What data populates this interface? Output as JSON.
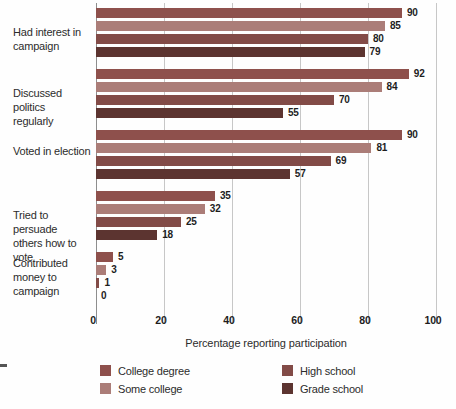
{
  "chart_data": {
    "type": "bar",
    "orientation": "horizontal",
    "title": "",
    "xlabel": "Percentage reporting participation",
    "xlim": [
      0,
      100
    ],
    "xticks": [
      0,
      20,
      40,
      60,
      80,
      100
    ],
    "grid": "vertical",
    "legend_position": "bottom",
    "categories": [
      {
        "label": "Had interest in campaign",
        "lines": [
          "Had interest in",
          "campaign"
        ]
      },
      {
        "label": "Discussed politics regularly",
        "lines": [
          "Discussed politics",
          "regularly"
        ]
      },
      {
        "label": "Voted in election",
        "lines": [
          "Voted in election"
        ]
      },
      {
        "label": "Tried to persuade others how to vote",
        "lines": [
          "Tried to persuade",
          "others how to vote"
        ]
      },
      {
        "label": "Contributed money to campaign",
        "lines": [
          "Contributed",
          "money to",
          "campaign"
        ]
      }
    ],
    "series": [
      {
        "name": "College degree",
        "color": "#8e504c",
        "values": [
          90,
          92,
          90,
          35,
          5
        ]
      },
      {
        "name": "Some college",
        "color": "#ab7d78",
        "values": [
          85,
          84,
          81,
          32,
          3
        ]
      },
      {
        "name": "High school",
        "color": "#824b47",
        "values": [
          80,
          70,
          69,
          25,
          1
        ]
      },
      {
        "name": "Grade school",
        "color": "#5c3430",
        "values": [
          79,
          55,
          57,
          18,
          0
        ]
      }
    ],
    "legend": {
      "columns": [
        [
          "College degree",
          "Some college"
        ],
        [
          "High school",
          "Grade school"
        ]
      ]
    }
  }
}
